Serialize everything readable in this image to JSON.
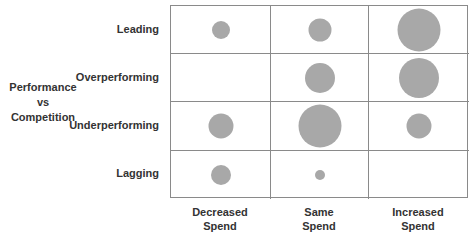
{
  "chart_data": {
    "type": "bubble-matrix",
    "title": "",
    "ylabel": "Performance vs Competition",
    "xlabel": "",
    "rows": [
      "Leading",
      "Overperforming",
      "Underperforming",
      "Lagging"
    ],
    "columns": [
      "Decreased Spend",
      "Same Spend",
      "Increased Spend"
    ],
    "column_lines": [
      [
        "Decreased",
        "Spend"
      ],
      [
        "Same",
        "Spend"
      ],
      [
        "Increased",
        "Spend"
      ]
    ],
    "ylabel_lines": [
      "Performance",
      "vs",
      "Competition"
    ],
    "bubble_diameters_px": [
      [
        18,
        23,
        43
      ],
      [
        0,
        30,
        40
      ],
      [
        25,
        43,
        25
      ],
      [
        20,
        10,
        0
      ]
    ],
    "grid": true,
    "bubble_color": "#a8a8a8",
    "grid_color": "#8a8a8a"
  }
}
